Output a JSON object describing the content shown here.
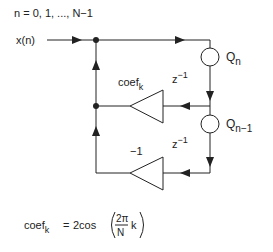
{
  "diagram": {
    "range_label": "n = 0, 1, ..., N−1",
    "input_label": "x(n)",
    "nodes": {
      "q_n": {
        "base": "Q",
        "sub": "n"
      },
      "q_n1": {
        "base": "Q",
        "sub": "n−1"
      }
    },
    "delays": [
      {
        "base": "z",
        "sup": "−1"
      },
      {
        "base": "z",
        "sup": "−1"
      }
    ],
    "gains": {
      "coef": {
        "base": "coef",
        "sub": "k"
      },
      "neg_one": "−1"
    },
    "formula": {
      "lhs_base": "coef",
      "lhs_sub": "k",
      "equals": "=",
      "func": "2cos",
      "numerator": "2π",
      "denominator": "N",
      "var": "k"
    },
    "colors": {
      "line": "#222222",
      "background": "#ffffff"
    }
  }
}
